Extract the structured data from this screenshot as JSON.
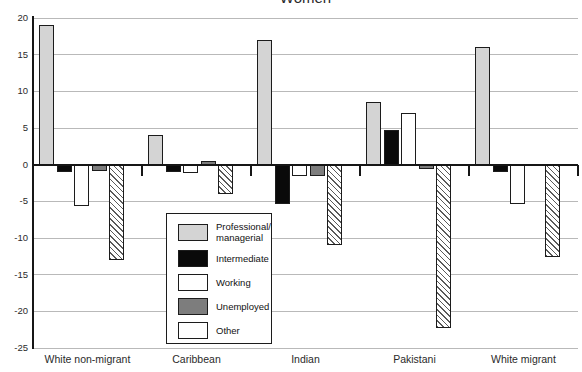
{
  "title": "Women",
  "chart_data": {
    "type": "bar",
    "title": "Women",
    "categories": [
      "White non-migrant",
      "Caribbean",
      "Indian",
      "Pakistani",
      "White migrant"
    ],
    "series": [
      {
        "name": "Professional/managerial",
        "legend_label": "Professional/\nmanagerial",
        "color": "#d4d4d4",
        "values": [
          19,
          4,
          17,
          8.5,
          16
        ]
      },
      {
        "name": "Intermediate",
        "legend_label": "Intermediate",
        "color": "#0a0a0a",
        "values": [
          -1,
          -1,
          -5.3,
          4.7,
          -1
        ]
      },
      {
        "name": "Working",
        "legend_label": "Working",
        "color": "#ffffff",
        "values": [
          -5.6,
          -1.2,
          -1.6,
          7,
          -5.3
        ]
      },
      {
        "name": "Unemployed",
        "legend_label": "Unemployed",
        "color": "#7d7d7d",
        "values": [
          -0.8,
          0.5,
          -1.5,
          -0.6,
          0
        ]
      },
      {
        "name": "Other",
        "legend_label": "Other",
        "color": "#ffffff",
        "pattern": "hatch",
        "values": [
          -13,
          -4,
          -11,
          -22.3,
          -12.6
        ]
      }
    ],
    "ylim": [
      -25,
      20
    ],
    "yticks": [
      20,
      15,
      10,
      5,
      0,
      -5,
      -10,
      -15,
      -20,
      -25
    ],
    "ytick_labels": [
      "20",
      "15",
      "10",
      "5",
      "0",
      "-5",
      "-10",
      "-15",
      "-20",
      "-25"
    ],
    "xlabel": "",
    "ylabel": "",
    "grid": true,
    "legend_position": "inside-bottom-left",
    "colors": {
      "gridline": "#b9b9b9",
      "axis": "#161616",
      "background": "#ffffff"
    }
  }
}
